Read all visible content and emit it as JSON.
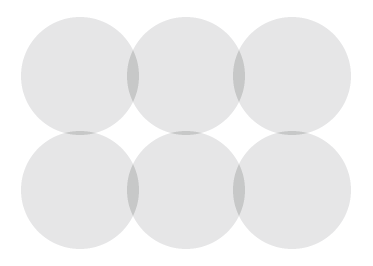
{
  "figure": {
    "title": "Six overlapping circles pattern",
    "canvas": {
      "width": 373,
      "height": 266,
      "background_color": "#ffffff"
    },
    "colors": {
      "circle_fill": "#e6e6e7",
      "overlap_fill": "#c7c8c8",
      "background": "#ffffff"
    },
    "geometry": {
      "radius": 59,
      "columns_x": [
        80,
        186,
        292
      ],
      "rows_y": [
        76,
        190
      ],
      "blend_mode": "difference-xor",
      "stroke": "none"
    },
    "circles": [
      {
        "id": "circle-top-left",
        "cx": 80,
        "cy": 76,
        "r": 59,
        "row": "top",
        "column": "left"
      },
      {
        "id": "circle-top-center",
        "cx": 186,
        "cy": 76,
        "r": 59,
        "row": "top",
        "column": "center"
      },
      {
        "id": "circle-top-right",
        "cx": 292,
        "cy": 76,
        "r": 59,
        "row": "top",
        "column": "right"
      },
      {
        "id": "circle-bottom-left",
        "cx": 80,
        "cy": 190,
        "r": 59,
        "row": "bottom",
        "column": "left"
      },
      {
        "id": "circle-bottom-center",
        "cx": 186,
        "cy": 190,
        "r": 59,
        "row": "bottom",
        "column": "center"
      },
      {
        "id": "circle-bottom-right",
        "cx": 292,
        "cy": 190,
        "r": 59,
        "row": "bottom",
        "column": "right"
      }
    ],
    "counts": {
      "circles": 6,
      "rows": 2,
      "columns": 3
    },
    "extents": {
      "left": 21,
      "top": 17,
      "right": 351,
      "bottom": 249
    }
  }
}
